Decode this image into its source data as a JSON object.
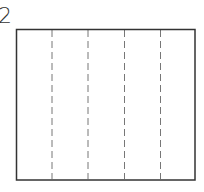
{
  "figure": {
    "label": "2",
    "rectangle": {
      "x": 16,
      "y": 29,
      "width": 179,
      "height": 151
    },
    "columns": 6,
    "dashed_lines_x": [
      52,
      88,
      124,
      160
    ],
    "border_color": "#333333",
    "dash_color": "#777777"
  }
}
